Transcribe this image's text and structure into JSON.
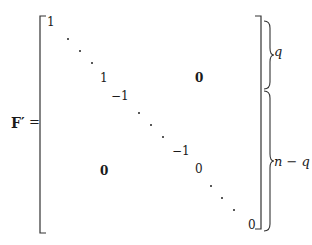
{
  "equation": {
    "lhs": "F′",
    "equals": "=",
    "entries": {
      "top_left_one": "1",
      "mid_one": "1",
      "neg_one_a": "−1",
      "neg_one_b": "−1",
      "upper_right_zero_block": "0",
      "lower_left_zero_block": "0",
      "mid_zero": "0",
      "bottom_right_zero": "0"
    },
    "braces": {
      "upper_label": "q",
      "lower_label": "n − q"
    }
  }
}
